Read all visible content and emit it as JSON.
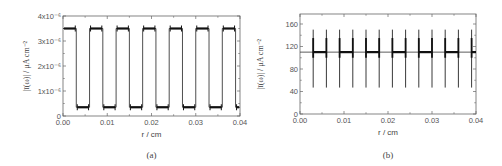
{
  "chart_data": [
    {
      "id": "a",
      "type": "line",
      "caption": "(a)",
      "title": "",
      "xlabel": "r / cm",
      "ylabel": "|ī(ω)| / μA cm⁻²",
      "xlim": [
        0,
        0.04
      ],
      "ylim": [
        0,
        4e-06
      ],
      "xticks": [
        "0.00",
        "0.01",
        "0.02",
        "0.03",
        "0.04"
      ],
      "yticks": [
        "0",
        "1x10⁻⁶",
        "2x10⁻⁶",
        "3x10⁻⁶",
        "4x10⁻⁶"
      ],
      "grid": false,
      "legend": null,
      "description": "Square-wave pattern alternating between ~3.5e-6 (high, on electrode bands) and ~3.5e-7 (low) with period 0.006 cm; small edge overshoots at transitions",
      "high_level": 3.5e-06,
      "low_level": 3.5e-07,
      "segments": [
        {
          "x0": 0.0,
          "x1": 0.003,
          "level": "high"
        },
        {
          "x0": 0.003,
          "x1": 0.006,
          "level": "low"
        },
        {
          "x0": 0.006,
          "x1": 0.009,
          "level": "high"
        },
        {
          "x0": 0.009,
          "x1": 0.012,
          "level": "low"
        },
        {
          "x0": 0.012,
          "x1": 0.015,
          "level": "high"
        },
        {
          "x0": 0.015,
          "x1": 0.018,
          "level": "low"
        },
        {
          "x0": 0.018,
          "x1": 0.021,
          "level": "high"
        },
        {
          "x0": 0.021,
          "x1": 0.024,
          "level": "low"
        },
        {
          "x0": 0.024,
          "x1": 0.027,
          "level": "high"
        },
        {
          "x0": 0.027,
          "x1": 0.03,
          "level": "low"
        },
        {
          "x0": 0.03,
          "x1": 0.033,
          "level": "high"
        },
        {
          "x0": 0.033,
          "x1": 0.036,
          "level": "low"
        },
        {
          "x0": 0.036,
          "x1": 0.039,
          "level": "high"
        },
        {
          "x0": 0.039,
          "x1": 0.04,
          "level": "low"
        }
      ]
    },
    {
      "id": "b",
      "type": "line",
      "caption": "(b)",
      "title": "",
      "xlabel": "r / cm",
      "ylabel": "|ī(ω)| / μA cm⁻²",
      "xlim": [
        0,
        0.04
      ],
      "ylim": [
        0,
        180
      ],
      "xticks": [
        "0.00",
        "0.01",
        "0.02",
        "0.03",
        "0.04"
      ],
      "yticks": [
        "0",
        "40",
        "80",
        "120",
        "160"
      ],
      "grid": false,
      "legend": null,
      "description": "Nearly flat baseline at ~110 with sharp spikes at band edges (up to ~150, down to ~47); plateau segments between paired spikes",
      "baseline": 110,
      "spike_max": 150,
      "spike_min": 47,
      "spike_x": [
        0.003,
        0.006,
        0.009,
        0.012,
        0.015,
        0.018,
        0.021,
        0.024,
        0.027,
        0.03,
        0.033,
        0.036,
        0.039
      ]
    }
  ]
}
